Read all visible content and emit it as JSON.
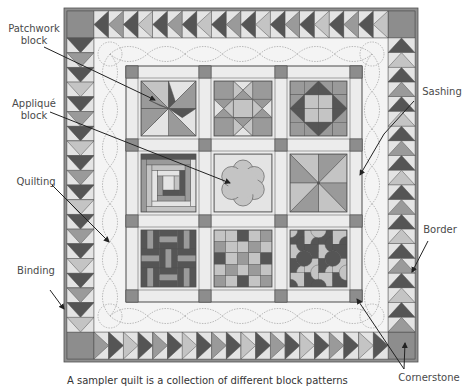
{
  "labels": {
    "patchwork_block": {
      "line1": "Patchwork",
      "line2": "block"
    },
    "applique_block": {
      "line1": "Appliqué",
      "line2": "block"
    },
    "quilting": "Quilting",
    "binding": "Binding",
    "sashing": "Sashing",
    "border": "Border",
    "cornerstone": "Cornerstone"
  },
  "caption": "A sampler quilt is a collection of different block patterns",
  "colors": {
    "binding": "#8f8f8f",
    "dark": "#555555",
    "mid": "#9a9a9a",
    "light": "#c4c4c4",
    "pale": "#e4e4e4",
    "background_panel": "#f4f4f4",
    "sashing": "#ececec",
    "cornerstone": "#8d8d8d",
    "line": "#444444",
    "stitch": "#a0a0a0"
  },
  "quilt": {
    "outer": {
      "x": 64,
      "y": 8,
      "w": 354,
      "h": 354
    },
    "border_width": 27,
    "grid_x": [
      126,
      199,
      275,
      350
    ],
    "grid_y": [
      66,
      139,
      215,
      290
    ],
    "cornerstone_size": 12,
    "blocks": [
      [
        "pinwheel",
        "ohio-star",
        "shoo-fly"
      ],
      [
        "log-cabin",
        "applique-flower",
        "pinwheel-large"
      ],
      [
        "rail-fence",
        "nine-patch-grid",
        "drunkards-path"
      ]
    ]
  },
  "leaders": [
    {
      "name": "patchwork",
      "from": [
        44,
        47
      ],
      "to": [
        155,
        100
      ]
    },
    {
      "name": "applique",
      "from": [
        50,
        112
      ],
      "to": [
        230,
        183
      ]
    },
    {
      "name": "quilting",
      "from": [
        52,
        185
      ],
      "to": [
        109,
        242
      ]
    },
    {
      "name": "binding",
      "from": [
        50,
        290
      ],
      "to": [
        64,
        309
      ]
    },
    {
      "name": "sashing",
      "from": [
        414,
        101
      ],
      "to": [
        384,
        134
      ]
    },
    {
      "name": "sashing2",
      "from": [
        384,
        134
      ],
      "to": [
        360,
        175
      ]
    },
    {
      "name": "border",
      "from": [
        428,
        241
      ],
      "to": [
        412,
        272
      ]
    },
    {
      "name": "cornerstone1",
      "from": [
        404,
        369
      ],
      "to": [
        357,
        299
      ]
    },
    {
      "name": "cornerstone2",
      "from": [
        404,
        369
      ],
      "to": [
        405,
        343
      ]
    }
  ]
}
